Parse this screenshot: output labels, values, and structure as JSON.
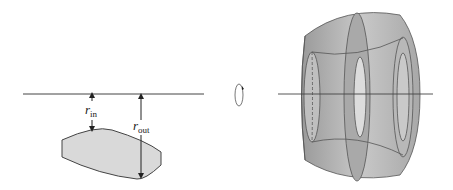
{
  "diagram": {
    "left_panel": {
      "axis": "rotation-axis",
      "labels": [
        {
          "symbol": "r",
          "subscript": "in"
        },
        {
          "symbol": "r",
          "subscript": "out"
        }
      ],
      "region_fill": "#d9d9d9"
    },
    "middle": {
      "icon": "rotation-arrow"
    },
    "right_panel": {
      "solid": "washer-solid-of-revolution",
      "fill": "#b5b5b5"
    }
  }
}
